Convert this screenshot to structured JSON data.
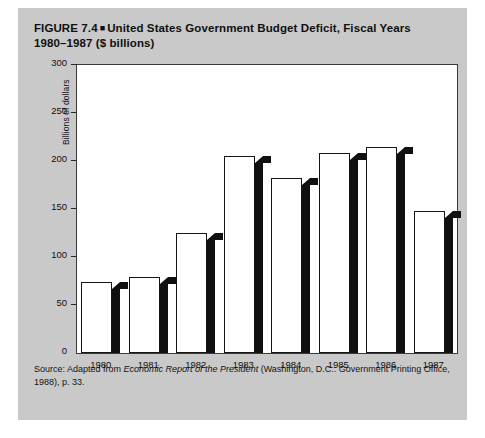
{
  "figure": {
    "title_line1_prefix": "FIGURE 7.4",
    "bullet": "■",
    "title_line1": "United States Government Budget Deficit, Fiscal Years",
    "title_line2": "1980–1987 ($ billions)",
    "panel_color": "#c9c9c9",
    "bar_fill": "#ffffff",
    "bar_outline": "#151515",
    "bar_shadow": "#101010"
  },
  "source": {
    "prefix": "Source: Adapted from ",
    "italic_title": "Economic Report of the President",
    "suffix": " (Washington, D.C.: Government Printing Office, 1988), p. 33."
  },
  "chart_data": {
    "type": "bar",
    "categories": [
      "1980",
      "1981",
      "1982",
      "1983",
      "1984",
      "1985",
      "1986",
      "1987"
    ],
    "values": [
      74,
      79,
      125,
      205,
      182,
      208,
      215,
      148
    ],
    "xlabel": "",
    "ylabel": "Billions of dollars",
    "ylim": [
      0,
      300
    ],
    "yticks": [
      0,
      50,
      100,
      150,
      200,
      250,
      300
    ],
    "ytick_labels": [
      "0",
      "50",
      "100",
      "150",
      "200",
      "250",
      "300"
    ],
    "grid": false,
    "legend": false,
    "units": "$ billions"
  }
}
